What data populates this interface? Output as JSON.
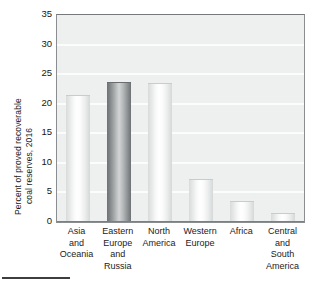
{
  "chart_data": {
    "type": "bar",
    "title": "",
    "xlabel": "",
    "ylabel": "Percent of proved recoverable coal reserves, 2016",
    "ylabel_lines": [
      "Percent of proved recoverable",
      "coal reserves, 2016"
    ],
    "ylim": [
      0,
      35
    ],
    "ytick_values": [
      0,
      5,
      10,
      15,
      20,
      25,
      30,
      35
    ],
    "ytick_labels": [
      "0",
      "5",
      "10",
      "15",
      "20",
      "25",
      "30",
      "35"
    ],
    "grid": true,
    "grid_axis": "y",
    "legend": "none",
    "categories": [
      "Asia and Oceania",
      "Eastern Europe and Russia",
      "North America",
      "Western Europe",
      "Africa",
      "Central and South America"
    ],
    "category_label_lines": [
      [
        "Asia",
        "and",
        "Oceania"
      ],
      [
        "Eastern",
        "Europe",
        "and",
        "Russia"
      ],
      [
        "North",
        "America"
      ],
      [
        "Western",
        "Europe"
      ],
      [
        "Africa"
      ],
      [
        "Central",
        "and",
        "South",
        "America"
      ]
    ],
    "values": [
      21.4,
      23.7,
      23.5,
      7.2,
      3.5,
      1.5
    ],
    "bar_styles": [
      "light",
      "dark",
      "light",
      "light",
      "light",
      "light"
    ],
    "colors": {
      "plot_background": "#eef0f0",
      "grid": "#fbfcfc",
      "axis": "#8a8e90",
      "bar_light": "#f2f3f3",
      "bar_dark": "#8d9092",
      "text": "#1b1b1b"
    }
  }
}
